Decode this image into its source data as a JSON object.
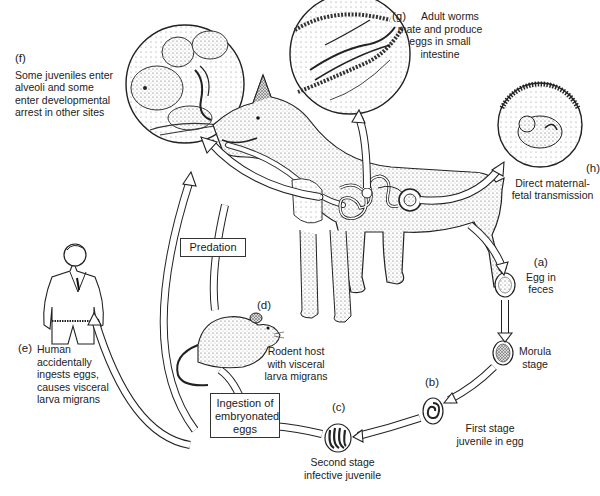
{
  "diagram": {
    "type": "life-cycle",
    "stages": [
      {
        "id": "a",
        "tag": "(a)",
        "text": "Egg in feces"
      },
      {
        "id": "morula",
        "tag": "",
        "text": "Morula stage"
      },
      {
        "id": "b",
        "tag": "(b)",
        "text": "First stage juvenile in egg"
      },
      {
        "id": "c",
        "tag": "(c)",
        "text": "Second stage infective juvenile"
      },
      {
        "id": "d",
        "tag": "(d)",
        "text": "Rodent host with visceral larva migrans"
      },
      {
        "id": "e",
        "tag": "(e)",
        "text": "Human accidentally ingests eggs, causes visceral larva migrans"
      },
      {
        "id": "f",
        "tag": "(f)",
        "text": "Some juveniles enter alveoli and some enter developmental arrest in other sites"
      },
      {
        "id": "g",
        "tag": "(g)",
        "text": "Adult worms mate and produce eggs in small intestine"
      },
      {
        "id": "h",
        "tag": "(h)",
        "text": "Direct maternal-fetal transmission"
      }
    ],
    "boxes": {
      "predation": "Predation",
      "ingestion": "Ingestion of embryonated eggs"
    }
  },
  "labels": {
    "f_tag": "(f)",
    "f_l1": "Some juveniles enter",
    "f_l2": "alveoli and some",
    "f_l3": "enter developmental",
    "f_l4": "arrest in other sites",
    "g_tag": "(g)",
    "g_l1": "Adult worms",
    "g_l2": "mate and produce",
    "g_l3": "eggs in small",
    "g_l4": "intestine",
    "h_tag": "(h)",
    "h_l1": "Direct maternal-",
    "h_l2": "fetal transmission",
    "a_tag": "(a)",
    "a_l1": "Egg in",
    "a_l2": "feces",
    "m_l1": "Morula",
    "m_l2": "stage",
    "b_tag": "(b)",
    "b_l1": "First stage",
    "b_l2": "juvenile in egg",
    "c_tag": "(c)",
    "c_l1": "Second stage",
    "c_l2": "infective juvenile",
    "d_tag": "(d)",
    "d_l1": "Rodent host",
    "d_l2": "with visceral",
    "d_l3": "larva migrans",
    "e_tag": "(e)",
    "e_l1": "Human",
    "e_l2": "accidentally",
    "e_l3": "ingests eggs,",
    "e_l4": "causes visceral",
    "e_l5": "larva migrans",
    "predation": "Predation",
    "ing_l1": "Ingestion of",
    "ing_l2": "embryonated",
    "ing_l3": "eggs"
  }
}
